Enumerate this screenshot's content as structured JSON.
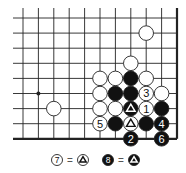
{
  "diagram": {
    "type": "go-board-corner",
    "grid": {
      "columns": 11,
      "rows": 9,
      "origin_x": 23,
      "origin_y": 18,
      "spacing_x": 15.4,
      "spacing_y": 15.1,
      "line_extend_left": 10,
      "line_extend_top": 10,
      "right_edge_thick": true,
      "bottom_edge_thick": true,
      "star_points": [
        [
          1,
          5
        ]
      ]
    },
    "colors": {
      "line": "#222222",
      "black_stone": "#111111",
      "white_stone": "#ffffff",
      "stone_outline": "#222222"
    },
    "stones": [
      {
        "col": 8,
        "row": 1,
        "color": "white",
        "label": ""
      },
      {
        "col": 7,
        "row": 3,
        "color": "white",
        "label": ""
      },
      {
        "col": 5,
        "row": 4,
        "color": "white",
        "label": ""
      },
      {
        "col": 6,
        "row": 4,
        "color": "white",
        "label": ""
      },
      {
        "col": 7,
        "row": 4,
        "color": "black",
        "label": ""
      },
      {
        "col": 8,
        "row": 4,
        "color": "white",
        "label": ""
      },
      {
        "col": 5,
        "row": 5,
        "color": "white",
        "label": ""
      },
      {
        "col": 6,
        "row": 5,
        "color": "black",
        "label": ""
      },
      {
        "col": 7,
        "row": 5,
        "color": "black",
        "label": ""
      },
      {
        "col": 8,
        "row": 5,
        "color": "white",
        "label": "3"
      },
      {
        "col": 9,
        "row": 5,
        "color": "white",
        "label": ""
      },
      {
        "col": 2,
        "row": 6,
        "color": "white",
        "label": ""
      },
      {
        "col": 5,
        "row": 6,
        "color": "white",
        "label": ""
      },
      {
        "col": 6,
        "row": 6,
        "color": "white",
        "label": ""
      },
      {
        "col": 7,
        "row": 6,
        "color": "black",
        "label": "triangle"
      },
      {
        "col": 8,
        "row": 6,
        "color": "white",
        "label": "1"
      },
      {
        "col": 9,
        "row": 6,
        "color": "black",
        "label": ""
      },
      {
        "col": 5,
        "row": 7,
        "color": "white",
        "label": "5"
      },
      {
        "col": 6,
        "row": 7,
        "color": "black",
        "label": ""
      },
      {
        "col": 7,
        "row": 7,
        "color": "white",
        "label": "triangle"
      },
      {
        "col": 8,
        "row": 7,
        "color": "black",
        "label": ""
      },
      {
        "col": 9,
        "row": 7,
        "color": "black",
        "label": "4"
      },
      {
        "col": 7,
        "row": 8,
        "color": "black",
        "label": "2"
      },
      {
        "col": 9,
        "row": 8,
        "color": "black",
        "label": "6"
      }
    ],
    "legend": [
      {
        "stone": {
          "color": "white",
          "label": "7"
        },
        "equals": "=",
        "target": {
          "color": "white",
          "label": "triangle"
        },
        "x": 57
      },
      {
        "stone": {
          "color": "black",
          "label": "8"
        },
        "equals": "=",
        "target": {
          "color": "black",
          "label": "triangle"
        },
        "x": 108
      }
    ]
  }
}
